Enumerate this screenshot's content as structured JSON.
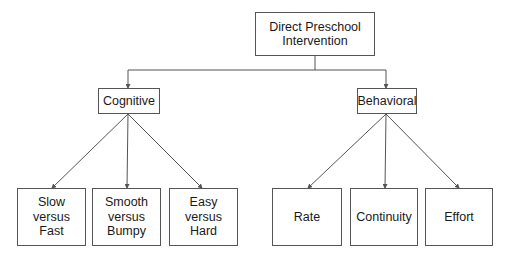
{
  "diagram": {
    "root": {
      "label_line1": "Direct Preschool",
      "label_line2": "Intervention"
    },
    "branches": [
      {
        "label": "Cognitive",
        "children": [
          {
            "line1": "Slow",
            "line2": "versus",
            "line3": "Fast"
          },
          {
            "line1": "Smooth",
            "line2": "versus",
            "line3": "Bumpy"
          },
          {
            "line1": "Easy",
            "line2": "versus",
            "line3": "Hard"
          }
        ]
      },
      {
        "label": "Behavioral",
        "children": [
          {
            "label": "Rate"
          },
          {
            "label": "Continuity"
          },
          {
            "label": "Effort"
          }
        ]
      }
    ],
    "colors": {
      "line": "#555555",
      "border": "#555555",
      "text": "#1a1a1a",
      "background": "#ffffff"
    }
  }
}
